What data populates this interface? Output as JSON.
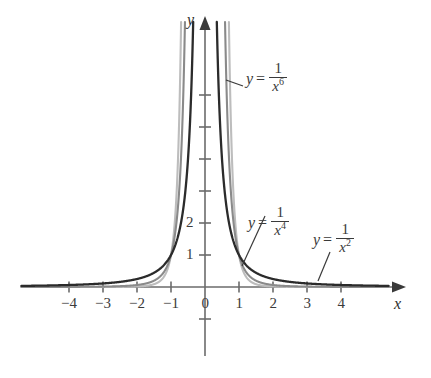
{
  "chart_data": {
    "type": "line",
    "title": "",
    "xlabel": "x",
    "ylabel": "y",
    "xlim": [
      -4.9,
      5.6
    ],
    "ylim": [
      -2.1,
      8.4
    ],
    "grid": false,
    "legend_position": "inline-annotations",
    "x_ticks": [
      {
        "value": -4,
        "label": "−4"
      },
      {
        "value": -3,
        "label": "−3"
      },
      {
        "value": -2,
        "label": "−2"
      },
      {
        "value": -1,
        "label": "−1"
      },
      {
        "value": 0,
        "label": "0"
      },
      {
        "value": 1,
        "label": "1"
      },
      {
        "value": 2,
        "label": "2"
      },
      {
        "value": 3,
        "label": "3"
      },
      {
        "value": 4,
        "label": "4"
      }
    ],
    "y_ticks": [
      {
        "value": -1,
        "label": ""
      },
      {
        "value": 1,
        "label": "1"
      },
      {
        "value": 2,
        "label": "2"
      },
      {
        "value": 3,
        "label": ""
      },
      {
        "value": 4,
        "label": ""
      },
      {
        "value": 5,
        "label": ""
      },
      {
        "value": 6,
        "label": ""
      }
    ],
    "series": [
      {
        "name": "y = 1/x^2",
        "exponent": 2,
        "color": "#2b2b2b",
        "width": 2.3,
        "label_lhs": "y",
        "label_eq": "=",
        "label_numerator": "1",
        "label_denominator_base": "x",
        "label_denominator_exp": "2"
      },
      {
        "name": "y = 1/x^4",
        "exponent": 4,
        "color": "#8a8a8a",
        "width": 2.1,
        "label_lhs": "y",
        "label_eq": "=",
        "label_numerator": "1",
        "label_denominator_base": "x",
        "label_denominator_exp": "4"
      },
      {
        "name": "y = 1/x^6",
        "exponent": 6,
        "color": "#bdbdbd",
        "width": 2.1,
        "label_lhs": "y",
        "label_eq": "=",
        "label_numerator": "1",
        "label_denominator_base": "x",
        "label_denominator_exp": "6"
      }
    ],
    "annotations": [
      {
        "text": "y = 1/x^6",
        "series": 2,
        "leader": true
      },
      {
        "text": "y = 1/x^4",
        "series": 1,
        "leader": true
      },
      {
        "text": "y = 1/x^2",
        "series": 0,
        "leader": true
      }
    ]
  },
  "axes": {
    "x_name": "x",
    "y_name": "y"
  },
  "colors": {
    "axis": "#6b6b6b",
    "curve_dark": "#2b2b2b",
    "curve_mid": "#8a8a8a",
    "curve_light": "#bdbdbd",
    "text": "#3a3a3a",
    "background": "#ffffff"
  }
}
